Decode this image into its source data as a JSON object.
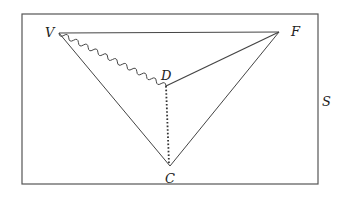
{
  "diagram": {
    "region_label": "S",
    "points": {
      "V": "V",
      "F": "F",
      "D": "D",
      "C": "C"
    },
    "edges": [
      {
        "from": "V",
        "to": "F",
        "style": "solid"
      },
      {
        "from": "V",
        "to": "C",
        "style": "solid"
      },
      {
        "from": "F",
        "to": "C",
        "style": "solid"
      },
      {
        "from": "F",
        "to": "D",
        "style": "solid"
      },
      {
        "from": "V",
        "to": "D",
        "style": "wavy"
      },
      {
        "from": "D",
        "to": "C",
        "style": "dotted"
      }
    ],
    "colors": {
      "line": "#444444",
      "frame": "#555555",
      "text": "#222222"
    }
  }
}
